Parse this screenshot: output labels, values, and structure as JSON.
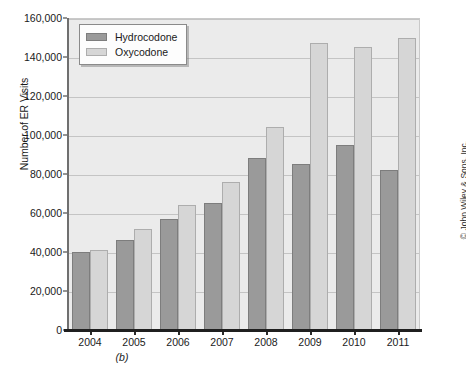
{
  "chart_data": {
    "type": "bar",
    "title": "",
    "subtitle": "",
    "caption": "(b)",
    "xlabel": "",
    "ylabel": "Number of ER Visits",
    "categories": [
      "2004",
      "2005",
      "2006",
      "2007",
      "2008",
      "2009",
      "2010",
      "2011"
    ],
    "series": [
      {
        "name": "Hydrocodone",
        "color": "#9a9a9a",
        "values": [
          40000,
          46000,
          57000,
          65000,
          88000,
          85000,
          95000,
          82000
        ]
      },
      {
        "name": "Oxycodone",
        "color": "#d6d6d6",
        "values": [
          41000,
          52000,
          64000,
          76000,
          104000,
          147000,
          145000,
          150000
        ]
      }
    ],
    "ylim": [
      0,
      160000
    ],
    "ytick_step": 20000,
    "yticks": [
      "0",
      "20,000",
      "40,000",
      "60,000",
      "80,000",
      "100,000",
      "120,000",
      "140,000",
      "160,000"
    ],
    "ytick_values": [
      0,
      20000,
      40000,
      60000,
      80000,
      100000,
      120000,
      140000,
      160000
    ],
    "grid": true,
    "grid_axis": "y",
    "legend_position": "top-left",
    "plot_background": "#ebebeb",
    "gridline_color": "#c4c4c4"
  },
  "legend": {
    "items": [
      {
        "label": "Hydrocodone",
        "swatch": "hydro"
      },
      {
        "label": "Oxycodone",
        "swatch": "oxy"
      }
    ]
  },
  "credit": {
    "text": "© John Wiley & Sons, Inc."
  }
}
